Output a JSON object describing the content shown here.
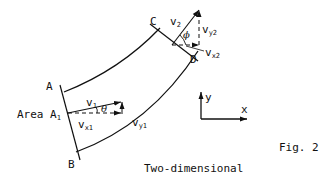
{
  "figure": {
    "caption": "Fig. 2",
    "subtitle": "Two-dimensional",
    "points": {
      "A": "A",
      "B": "B",
      "C": "C",
      "D": "D"
    },
    "area_label": "Area A",
    "area_sub": "1",
    "vectors": {
      "v1": {
        "base": "v",
        "sub": "1"
      },
      "vx1": {
        "base": "v",
        "sub": "x1"
      },
      "vy1": {
        "base": "v",
        "sub": "y1"
      },
      "v2": {
        "base": "v",
        "sub": "2"
      },
      "vx2": {
        "base": "v",
        "sub": "x2"
      },
      "vy2": {
        "base": "v",
        "sub": "y2"
      }
    },
    "angles": {
      "theta": "θ",
      "phi": "ϕ"
    },
    "axes": {
      "x": "x",
      "y": "y"
    },
    "colors": {
      "ink": "#111111",
      "background": "#ffffff"
    }
  }
}
